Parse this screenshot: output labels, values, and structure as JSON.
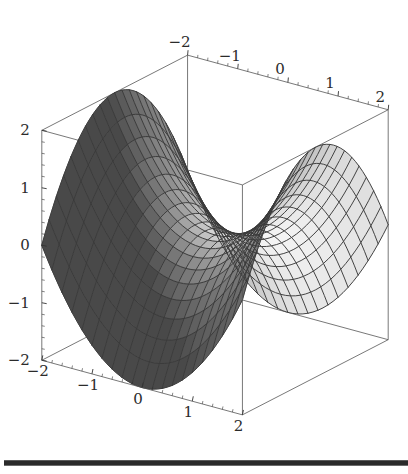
{
  "figure": {
    "kind": "surface-plot-3d",
    "background_color": "#ffffff",
    "frame_color": "#555555",
    "mesh_color": "#3a3a3a",
    "surface_light_color": "#f2f2f2",
    "surface_dark_color": "#3c3c3c"
  },
  "axes": {
    "x": {
      "name": "x-axis",
      "tick_labels": [
        "-2",
        "-1",
        "0",
        "1",
        "2"
      ],
      "tick_values": [
        -2,
        -1,
        0,
        1,
        2
      ],
      "range": [
        -2,
        2
      ]
    },
    "y": {
      "name": "y-axis",
      "tick_labels": [
        "-2",
        "-1",
        "0",
        "1",
        "2"
      ],
      "tick_values": [
        -2,
        -1,
        0,
        1,
        2
      ],
      "range": [
        -2,
        2
      ]
    },
    "z": {
      "name": "z-axis",
      "tick_labels": [
        "-2",
        "-1",
        "0",
        "1",
        "2"
      ],
      "tick_values": [
        -2,
        -1,
        0,
        1,
        2
      ],
      "range": [
        -2,
        2
      ]
    }
  },
  "chart_data": {
    "type": "surface",
    "title": "",
    "xlabel": "",
    "ylabel": "",
    "zlabel": "",
    "surface_function": "z = (x*x - y*y) / 2",
    "xlim": [
      -2,
      2
    ],
    "ylim": [
      -2,
      2
    ],
    "zlim": [
      -2,
      2
    ],
    "grid": true,
    "legend": false,
    "mesh_rows": 20,
    "mesh_cols": 20,
    "colormap": "grayscale",
    "view": {
      "azimuth_deg": 36,
      "elevation_deg": 22,
      "scale": 62,
      "origin_x": 215,
      "origin_y": 235
    },
    "x": [
      -2,
      -1.8,
      -1.6,
      -1.4,
      -1.2,
      -1,
      -0.8,
      -0.6,
      -0.4,
      -0.2,
      0,
      0.2,
      0.4,
      0.6,
      0.8,
      1,
      1.2,
      1.4,
      1.6,
      1.8,
      2
    ],
    "y": [
      -2,
      -1.8,
      -1.6,
      -1.4,
      -1.2,
      -1,
      -0.8,
      -0.6,
      -0.4,
      -0.2,
      0,
      0.2,
      0.4,
      0.6,
      0.8,
      1,
      1.2,
      1.4,
      1.6,
      1.8,
      2
    ],
    "z_corners": {
      "x-2_y-2": 0,
      "x-2_y2": 0,
      "x2_y-2": 0,
      "x2_y2": 0,
      "x0_y0": 0,
      "x0_y-2": -2,
      "x0_y2": -2,
      "x-2_y0": 2,
      "x2_y0": 2
    }
  },
  "page": {
    "rule": {
      "name": "horizontal-rule",
      "color": "#2a2a2a"
    }
  }
}
